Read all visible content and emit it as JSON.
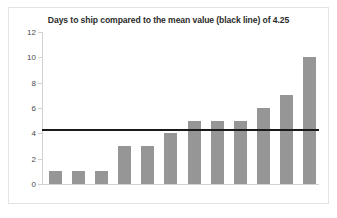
{
  "chart_data": {
    "type": "bar",
    "title": "Days to ship compared to the mean value (black line) of 4.25",
    "xlabel": "",
    "ylabel": "",
    "categories": [
      "1",
      "2",
      "3",
      "4",
      "5",
      "6",
      "7",
      "8",
      "9",
      "10",
      "11",
      "12"
    ],
    "values": [
      1,
      1,
      1,
      3,
      3,
      4,
      5,
      5,
      5,
      6,
      7,
      10
    ],
    "ylim": [
      0,
      12
    ],
    "yticks": [
      0,
      2,
      4,
      6,
      8,
      10,
      12
    ],
    "ytick_labels": [
      "0",
      "2",
      "4",
      "6",
      "8",
      "10",
      "12"
    ],
    "xtick_labels": [],
    "grid": false,
    "legend": null,
    "annotations": [
      {
        "name": "mean-line",
        "type": "hline",
        "value": 4.25,
        "label": "mean value (black line) of 4.25",
        "color": "#1a1a1a"
      }
    ],
    "colors": {
      "bar": "#969696",
      "mean_line": "#1a1a1a",
      "axis": "#d2d2d2",
      "title_text": "#2b2b2b",
      "tick_text": "#4a4a4a",
      "plot_background": "#ffffff",
      "frame_border": "#e3e3e3"
    }
  }
}
